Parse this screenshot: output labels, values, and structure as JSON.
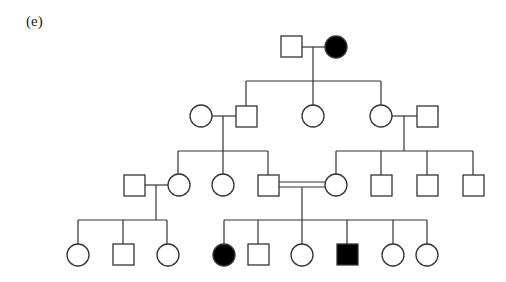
{
  "panel_label": "(e)",
  "colors": {
    "affected": "#000000",
    "unaffected": "#ffffff",
    "line": "#333333"
  },
  "legend": {
    "square": "male",
    "circle": "female",
    "filled": "affected",
    "double_line": "consanguineous mating"
  },
  "pedigree": {
    "generations": [
      {
        "id": "I",
        "individuals": [
          {
            "id": "I-1",
            "sex": "male",
            "affected": false
          },
          {
            "id": "I-2",
            "sex": "female",
            "affected": true
          }
        ]
      },
      {
        "id": "II",
        "individuals": [
          {
            "id": "II-1",
            "sex": "female",
            "affected": false,
            "note": "married in"
          },
          {
            "id": "II-2",
            "sex": "male",
            "affected": false,
            "parents": [
              "I-1",
              "I-2"
            ]
          },
          {
            "id": "II-3",
            "sex": "female",
            "affected": false,
            "parents": [
              "I-1",
              "I-2"
            ]
          },
          {
            "id": "II-4",
            "sex": "female",
            "affected": false,
            "parents": [
              "I-1",
              "I-2"
            ]
          },
          {
            "id": "II-5",
            "sex": "male",
            "affected": false,
            "note": "married in"
          }
        ]
      },
      {
        "id": "III",
        "individuals": [
          {
            "id": "III-1",
            "sex": "male",
            "affected": false,
            "note": "married in"
          },
          {
            "id": "III-2",
            "sex": "female",
            "affected": false,
            "parents": [
              "II-1",
              "II-2"
            ]
          },
          {
            "id": "III-3",
            "sex": "female",
            "affected": false,
            "parents": [
              "II-1",
              "II-2"
            ]
          },
          {
            "id": "III-4",
            "sex": "male",
            "affected": false,
            "parents": [
              "II-1",
              "II-2"
            ]
          },
          {
            "id": "III-5",
            "sex": "female",
            "affected": false,
            "parents": [
              "II-4",
              "II-5"
            ]
          },
          {
            "id": "III-6",
            "sex": "male",
            "affected": false,
            "parents": [
              "II-4",
              "II-5"
            ]
          },
          {
            "id": "III-7",
            "sex": "male",
            "affected": false,
            "parents": [
              "II-4",
              "II-5"
            ]
          },
          {
            "id": "III-8",
            "sex": "male",
            "affected": false,
            "parents": [
              "II-4",
              "II-5"
            ]
          }
        ],
        "consanguineous_pairs": [
          [
            "III-4",
            "III-5"
          ]
        ]
      },
      {
        "id": "IV",
        "individuals": [
          {
            "id": "IV-1",
            "sex": "female",
            "affected": false,
            "parents": [
              "III-1",
              "III-2"
            ]
          },
          {
            "id": "IV-2",
            "sex": "male",
            "affected": false,
            "parents": [
              "III-1",
              "III-2"
            ]
          },
          {
            "id": "IV-3",
            "sex": "female",
            "affected": false,
            "parents": [
              "III-1",
              "III-2"
            ]
          },
          {
            "id": "IV-4",
            "sex": "female",
            "affected": true,
            "parents": [
              "III-4",
              "III-5"
            ]
          },
          {
            "id": "IV-5",
            "sex": "male",
            "affected": false,
            "parents": [
              "III-4",
              "III-5"
            ]
          },
          {
            "id": "IV-6",
            "sex": "female",
            "affected": false,
            "parents": [
              "III-4",
              "III-5"
            ]
          },
          {
            "id": "IV-7",
            "sex": "male",
            "affected": true,
            "parents": [
              "III-4",
              "III-5"
            ]
          },
          {
            "id": "IV-8",
            "sex": "female",
            "affected": false,
            "parents": [
              "III-4",
              "III-5"
            ]
          },
          {
            "id": "IV-9",
            "sex": "female",
            "affected": false,
            "parents": [
              "III-4",
              "III-5"
            ]
          }
        ]
      }
    ]
  }
}
